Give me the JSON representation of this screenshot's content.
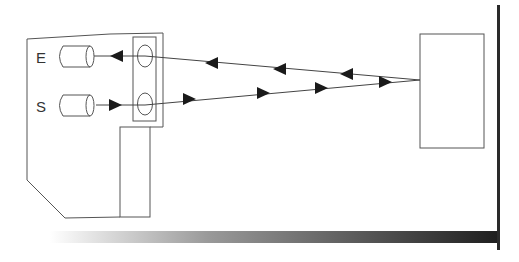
{
  "diagram": {
    "labels": {
      "emitter_receiver_top": "E",
      "sender_bottom": "S"
    },
    "colors": {
      "stroke": "#555555",
      "arrow": "#1a1a1a",
      "wall": "#2a2a2a",
      "floor_start": "#ffffff",
      "floor_end": "#1e1e1e"
    }
  }
}
